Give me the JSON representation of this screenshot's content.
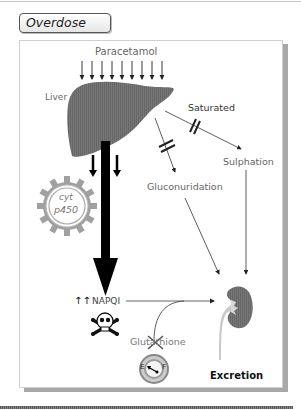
{
  "header": {
    "title": "Overdose"
  },
  "diagram": {
    "labels": {
      "paracetamol": "Paracetamol",
      "liver": "Liver",
      "saturated": "Saturated",
      "sulphation": "Sulphation",
      "gluconuridation": "Gluconuridation",
      "cyt": "cyt",
      "p450": "p450",
      "napqi_arrows": "↑↑",
      "napqi": "NAPQI",
      "glutathione": "Glutathione",
      "enzyme_e": "E",
      "enzyme_f": "F",
      "excretion": "Excretion"
    },
    "colors": {
      "organ_fill": "#6e6e6e",
      "text_gray": "#666666",
      "arrow": "#222222",
      "gear": "#9a9a9a",
      "shadow": "#a8a8a8"
    },
    "icons": [
      "liver-icon",
      "cytochrome-p450-gear-icon",
      "skull-crossbones-icon",
      "glutathione-enzyme-icon",
      "kidney-icon",
      "blocked-cross-icon",
      "saturated-block-icon"
    ]
  }
}
